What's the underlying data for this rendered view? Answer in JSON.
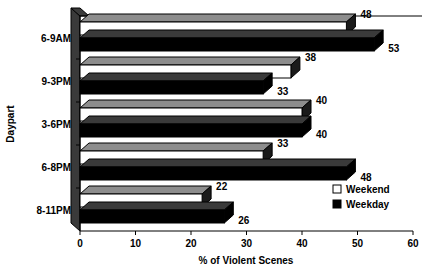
{
  "chart_data": {
    "type": "bar",
    "orientation": "horizontal",
    "title": "",
    "xlabel": "% of Violent Scenes",
    "ylabel": "Daypart",
    "categories": [
      "6-9AM",
      "9-3PM",
      "3-6PM",
      "6-8PM",
      "8-11PM"
    ],
    "series": [
      {
        "name": "Weekend",
        "values": [
          48,
          38,
          40,
          33,
          22
        ],
        "color": "#ffffff"
      },
      {
        "name": "Weekday",
        "values": [
          53,
          33,
          40,
          48,
          26
        ],
        "color": "#000000"
      }
    ],
    "xlim": [
      0,
      60
    ],
    "xticks": [
      0,
      10,
      20,
      30,
      40,
      50,
      60
    ],
    "xtick_labels": [
      "0",
      "10",
      "20",
      "30",
      "40",
      "50",
      "60"
    ],
    "grid": false,
    "legend_position": "inside-right-lower",
    "data_labels": true,
    "style_3d": true
  },
  "axis": {
    "x_title": "% of Violent Scenes",
    "y_title": "Daypart"
  },
  "legend": {
    "entries": [
      {
        "label": "Weekend",
        "swatch": "open-square"
      },
      {
        "label": "Weekday",
        "swatch": "filled-square"
      }
    ]
  }
}
